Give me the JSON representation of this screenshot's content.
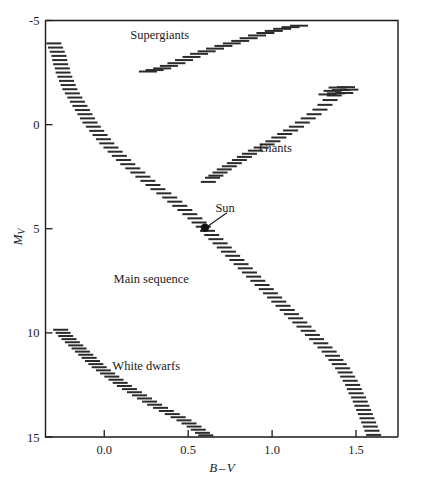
{
  "figure": {
    "title": "",
    "background": "#ffffff",
    "ink_color": "#1a1a1a"
  },
  "axes": {
    "x": {
      "label": "B",
      "label_minus": "–",
      "label2": "V",
      "full_label": "B–V",
      "ticks": [
        "0.0",
        "0.5",
        "1.0",
        "1.5"
      ],
      "tick_values": [
        0.0,
        0.5,
        1.0,
        1.5
      ],
      "range": [
        -0.35,
        1.75
      ]
    },
    "y": {
      "label": "M",
      "label_sub": "V",
      "full_label": "M_V",
      "ticks": [
        "-5",
        "0",
        "5",
        "10",
        "15"
      ],
      "tick_values": [
        -5,
        0,
        5,
        10,
        15
      ],
      "range": [
        -5,
        15
      ],
      "inverted": true
    }
  },
  "annotations": {
    "supergiants": "Supergiants",
    "giants": "Giants",
    "main_sequence": "Main sequence",
    "white_dwarfs": "White dwarfs",
    "sun": "Sun"
  },
  "chart_data": {
    "type": "scatter",
    "xlabel": "B–V",
    "ylabel": "M_V",
    "xlim": [
      -0.35,
      1.75
    ],
    "ylim": [
      15,
      -5
    ],
    "y_inverted": true,
    "grid": false,
    "legend": "none",
    "marker_style": "short-horizontal-dash",
    "annotations": [
      {
        "text": "Supergiants",
        "x": 0.33,
        "y": -4.1
      },
      {
        "text": "Giants",
        "x": 1.02,
        "y": 1.3
      },
      {
        "text": "Main sequence",
        "x": 0.28,
        "y": 7.6
      },
      {
        "text": "White dwarfs",
        "x": 0.25,
        "y": 11.8
      },
      {
        "text": "Sun",
        "x": 0.72,
        "y": 4.2
      }
    ],
    "special_points": [
      {
        "name": "Sun",
        "x": 0.6,
        "y": 4.95,
        "marker": "filled-circle"
      }
    ],
    "series": [
      {
        "name": "Main sequence",
        "points": [
          [
            -0.3,
            -3.9
          ],
          [
            -0.29,
            -3.7
          ],
          [
            -0.28,
            -3.5
          ],
          [
            -0.27,
            -3.3
          ],
          [
            -0.265,
            -3.1
          ],
          [
            -0.26,
            -2.9
          ],
          [
            -0.25,
            -2.7
          ],
          [
            -0.245,
            -2.5
          ],
          [
            -0.235,
            -2.3
          ],
          [
            -0.225,
            -2.1
          ],
          [
            -0.215,
            -1.9
          ],
          [
            -0.205,
            -1.7
          ],
          [
            -0.19,
            -1.5
          ],
          [
            -0.175,
            -1.3
          ],
          [
            -0.16,
            -1.1
          ],
          [
            -0.145,
            -0.9
          ],
          [
            -0.13,
            -0.7
          ],
          [
            -0.115,
            -0.5
          ],
          [
            -0.1,
            -0.3
          ],
          [
            -0.085,
            -0.1
          ],
          [
            -0.065,
            0.1
          ],
          [
            -0.045,
            0.3
          ],
          [
            -0.025,
            0.5
          ],
          [
            -0.005,
            0.7
          ],
          [
            0.015,
            0.9
          ],
          [
            0.04,
            1.1
          ],
          [
            0.065,
            1.3
          ],
          [
            0.09,
            1.5
          ],
          [
            0.115,
            1.7
          ],
          [
            0.14,
            1.9
          ],
          [
            0.17,
            2.1
          ],
          [
            0.2,
            2.3
          ],
          [
            0.23,
            2.5
          ],
          [
            0.26,
            2.7
          ],
          [
            0.29,
            2.9
          ],
          [
            0.32,
            3.1
          ],
          [
            0.355,
            3.3
          ],
          [
            0.39,
            3.5
          ],
          [
            0.42,
            3.7
          ],
          [
            0.45,
            3.9
          ],
          [
            0.48,
            4.1
          ],
          [
            0.51,
            4.3
          ],
          [
            0.54,
            4.5
          ],
          [
            0.565,
            4.7
          ],
          [
            0.59,
            4.9
          ],
          [
            0.615,
            5.1
          ],
          [
            0.64,
            5.3
          ],
          [
            0.665,
            5.5
          ],
          [
            0.69,
            5.7
          ],
          [
            0.715,
            5.9
          ],
          [
            0.74,
            6.1
          ],
          [
            0.765,
            6.3
          ],
          [
            0.79,
            6.5
          ],
          [
            0.815,
            6.7
          ],
          [
            0.84,
            6.9
          ],
          [
            0.865,
            7.1
          ],
          [
            0.89,
            7.3
          ],
          [
            0.915,
            7.5
          ],
          [
            0.94,
            7.7
          ],
          [
            0.965,
            7.9
          ],
          [
            0.99,
            8.1
          ],
          [
            1.015,
            8.3
          ],
          [
            1.04,
            8.5
          ],
          [
            1.065,
            8.7
          ],
          [
            1.09,
            8.9
          ],
          [
            1.115,
            9.1
          ],
          [
            1.14,
            9.3
          ],
          [
            1.165,
            9.5
          ],
          [
            1.19,
            9.7
          ],
          [
            1.215,
            9.9
          ],
          [
            1.24,
            10.1
          ],
          [
            1.265,
            10.3
          ],
          [
            1.29,
            10.5
          ],
          [
            1.315,
            10.7
          ],
          [
            1.34,
            10.9
          ],
          [
            1.36,
            11.1
          ],
          [
            1.38,
            11.3
          ],
          [
            1.4,
            11.5
          ],
          [
            1.42,
            11.7
          ],
          [
            1.435,
            11.9
          ],
          [
            1.45,
            12.1
          ],
          [
            1.465,
            12.3
          ],
          [
            1.48,
            12.5
          ],
          [
            1.49,
            12.7
          ],
          [
            1.5,
            12.9
          ],
          [
            1.515,
            13.1
          ],
          [
            1.525,
            13.3
          ],
          [
            1.535,
            13.5
          ],
          [
            1.545,
            13.7
          ],
          [
            1.555,
            13.9
          ],
          [
            1.565,
            14.1
          ],
          [
            1.575,
            14.3
          ],
          [
            1.585,
            14.5
          ],
          [
            1.595,
            14.7
          ],
          [
            1.605,
            14.9
          ]
        ]
      },
      {
        "name": "Giants",
        "points": [
          [
            0.62,
            2.75
          ],
          [
            0.645,
            2.55
          ],
          [
            0.665,
            2.45
          ],
          [
            0.69,
            2.3
          ],
          [
            0.715,
            2.15
          ],
          [
            0.745,
            2.0
          ],
          [
            0.775,
            1.85
          ],
          [
            0.805,
            1.7
          ],
          [
            0.835,
            1.55
          ],
          [
            0.865,
            1.4
          ],
          [
            0.9,
            1.25
          ],
          [
            0.935,
            1.1
          ],
          [
            0.97,
            0.95
          ],
          [
            1.005,
            0.8
          ],
          [
            1.04,
            0.62
          ],
          [
            1.075,
            0.45
          ],
          [
            1.11,
            0.28
          ],
          [
            1.145,
            0.1
          ],
          [
            1.18,
            -0.1
          ],
          [
            1.215,
            -0.3
          ],
          [
            1.25,
            -0.5
          ],
          [
            1.285,
            -0.72
          ],
          [
            1.315,
            -0.95
          ],
          [
            1.345,
            -1.18
          ],
          [
            1.37,
            -1.4
          ]
        ]
      },
      {
        "name": "Giant clump",
        "points": [
          [
            1.33,
            -1.45
          ],
          [
            1.38,
            -1.5
          ],
          [
            1.43,
            -1.52
          ],
          [
            1.36,
            -1.62
          ],
          [
            1.41,
            -1.66
          ],
          [
            1.46,
            -1.68
          ],
          [
            1.39,
            -1.78
          ],
          [
            1.44,
            -1.8
          ]
        ]
      },
      {
        "name": "Supergiants",
        "points": [
          [
            0.26,
            -2.55
          ],
          [
            0.3,
            -2.62
          ],
          [
            0.345,
            -2.7
          ],
          [
            0.385,
            -2.82
          ],
          [
            0.43,
            -2.95
          ],
          [
            0.475,
            -3.1
          ],
          [
            0.52,
            -3.25
          ],
          [
            0.565,
            -3.4
          ],
          [
            0.61,
            -3.52
          ],
          [
            0.66,
            -3.65
          ],
          [
            0.71,
            -3.78
          ],
          [
            0.76,
            -3.9
          ],
          [
            0.81,
            -4.02
          ],
          [
            0.86,
            -4.15
          ],
          [
            0.91,
            -4.28
          ],
          [
            0.96,
            -4.4
          ],
          [
            1.01,
            -4.5
          ],
          [
            1.06,
            -4.6
          ],
          [
            1.11,
            -4.68
          ],
          [
            1.16,
            -4.75
          ]
        ]
      },
      {
        "name": "White dwarfs",
        "points": [
          [
            -0.26,
            9.85
          ],
          [
            -0.245,
            10.0
          ],
          [
            -0.23,
            10.15
          ],
          [
            -0.21,
            10.3
          ],
          [
            -0.19,
            10.45
          ],
          [
            -0.17,
            10.6
          ],
          [
            -0.15,
            10.75
          ],
          [
            -0.13,
            10.9
          ],
          [
            -0.11,
            11.05
          ],
          [
            -0.09,
            11.2
          ],
          [
            -0.07,
            11.35
          ],
          [
            -0.05,
            11.5
          ],
          [
            -0.03,
            11.65
          ],
          [
            -0.005,
            11.8
          ],
          [
            0.02,
            11.95
          ],
          [
            0.045,
            12.1
          ],
          [
            0.07,
            12.25
          ],
          [
            0.095,
            12.4
          ],
          [
            0.12,
            12.55
          ],
          [
            0.15,
            12.7
          ],
          [
            0.18,
            12.85
          ],
          [
            0.21,
            13.0
          ],
          [
            0.24,
            13.15
          ],
          [
            0.27,
            13.3
          ],
          [
            0.3,
            13.45
          ],
          [
            0.335,
            13.6
          ],
          [
            0.37,
            13.75
          ],
          [
            0.405,
            13.9
          ],
          [
            0.44,
            14.05
          ],
          [
            0.475,
            14.2
          ],
          [
            0.505,
            14.35
          ],
          [
            0.535,
            14.5
          ],
          [
            0.56,
            14.65
          ],
          [
            0.585,
            14.8
          ],
          [
            0.605,
            14.92
          ]
        ]
      }
    ]
  }
}
